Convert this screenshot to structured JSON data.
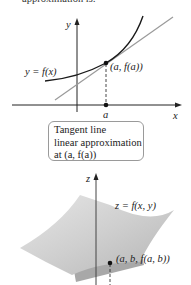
{
  "header": {
    "text": "approximation is:"
  },
  "graph2d": {
    "y_axis_label": "y",
    "x_axis_label": "x",
    "curve_label": "y = f(x)",
    "point_label": "(a, f(a))",
    "a_label": "a"
  },
  "callout": {
    "line1": "Tangent line",
    "line2": "linear approximation",
    "line3": "at (a, f(a))"
  },
  "graph3d": {
    "z_axis_label": "z",
    "surface_label": "z = f(x, y)",
    "point_label": "(a, b, f(a, b))"
  },
  "colors": {
    "curve": "#1a1a1a",
    "tangent": "#9a9a9a",
    "surface": "#c8c8c8",
    "plane": "#a8a8a8"
  }
}
